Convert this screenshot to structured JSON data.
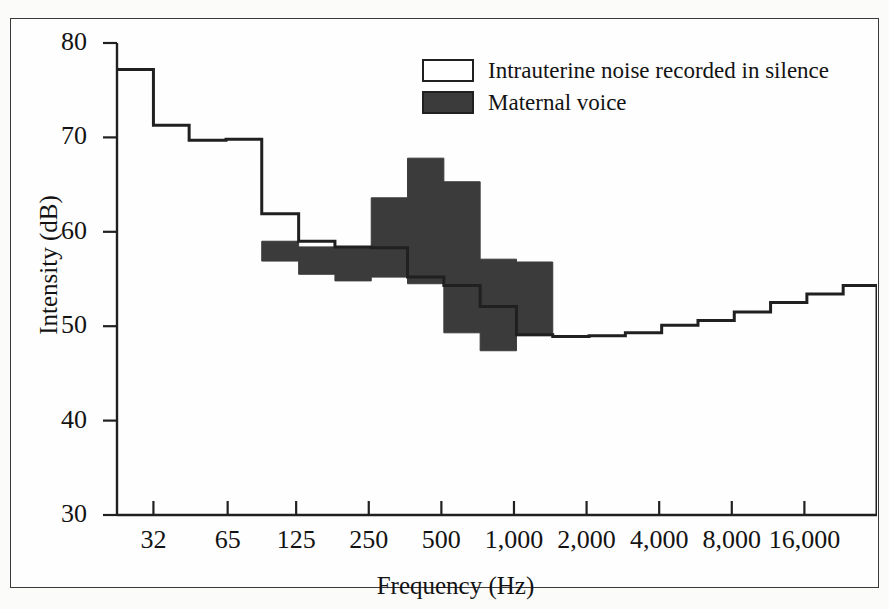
{
  "chart_data": {
    "type": "line",
    "title": "",
    "xlabel": "Frequency (Hz)",
    "ylabel": "Intensity (dB)",
    "xscale": "log2",
    "xlim": [
      22.6,
      32000
    ],
    "ylim": [
      30,
      80
    ],
    "yticks": [
      30,
      40,
      50,
      60,
      70,
      80
    ],
    "ytick_labels": [
      "30",
      "40",
      "50",
      "60",
      "70",
      "80"
    ],
    "xticks": [
      32,
      65,
      125,
      250,
      500,
      1000,
      2000,
      4000,
      8000,
      16000
    ],
    "xtick_labels": [
      "32",
      "65",
      "125",
      "250",
      "500",
      "1,000",
      "2,000",
      "4,000",
      "8,000",
      "16,000"
    ],
    "grid": false,
    "legend_position": "top-right",
    "series": [
      {
        "name": "Intrauterine noise recorded in silence",
        "style": "step",
        "fill": "none",
        "edge_color": "#202020",
        "x": [
          22.6,
          32,
          45,
          64,
          90,
          128,
          181,
          256,
          362,
          512,
          724,
          1024,
          1448,
          2048,
          2896,
          4096,
          5793,
          8192,
          11585,
          16384,
          23170,
          32000
        ],
        "values": [
          77.2,
          71.3,
          69.7,
          69.8,
          61.9,
          59.0,
          58.4,
          58.3,
          55.2,
          54.3,
          52.1,
          49.1,
          48.9,
          49.0,
          49.3,
          50.1,
          50.6,
          51.5,
          52.5,
          53.4,
          54.3,
          52.6
        ]
      },
      {
        "name": "Maternal voice",
        "style": "step-band",
        "fill": "#3b3b3b",
        "edge_color": "#3b3b3b",
        "x": [
          90,
          128,
          181,
          256,
          362,
          512,
          724,
          1024
        ],
        "upper": [
          59.0,
          58.4,
          58.3,
          63.6,
          67.8,
          65.3,
          57.1,
          56.8
        ],
        "lower": [
          56.9,
          55.5,
          54.8,
          55.2,
          54.5,
          49.3,
          47.4,
          49.0
        ]
      }
    ],
    "annotations": []
  },
  "legend": {
    "items": [
      {
        "label": "Intrauterine noise recorded in silence",
        "swatch": "hollow"
      },
      {
        "label": "Maternal voice",
        "swatch": "filled"
      }
    ]
  },
  "axes": {
    "y_title": "Intensity (dB)",
    "x_title": "Frequency (Hz)"
  },
  "colors": {
    "fill_dark": "#3b3b3b",
    "line": "#202020",
    "frame": "#3a3a3a",
    "background": "#fefefe"
  },
  "caption": ""
}
